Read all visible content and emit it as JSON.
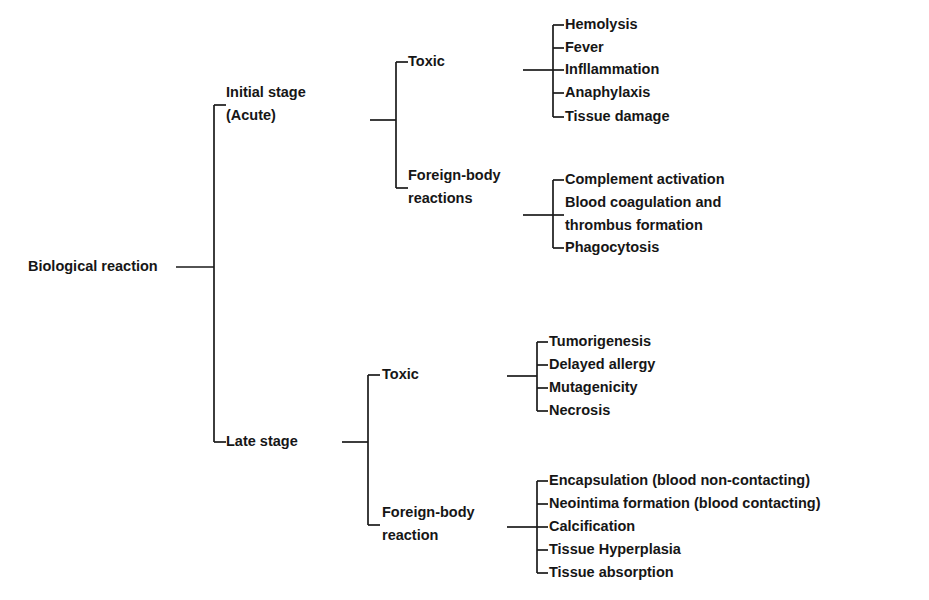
{
  "diagram": {
    "type": "tree",
    "orientation": "left-to-right",
    "title": "Biological reaction",
    "line_color": "#1a1a1a",
    "text_color": "#161616",
    "background_color": "#ffffff",
    "root": {
      "label": "Biological reaction",
      "children": [
        {
          "label": "Initial stage\n(Acute)",
          "lines": [
            "Initial stage",
            "(Acute)"
          ],
          "children": [
            {
              "label": "Toxic",
              "lines": [
                "Toxic"
              ],
              "children": [
                {
                  "label": "Hemolysis",
                  "lines": [
                    "Hemolysis"
                  ]
                },
                {
                  "label": "Fever",
                  "lines": [
                    "Fever"
                  ]
                },
                {
                  "label": "Infllammation",
                  "lines": [
                    "Infllammation"
                  ]
                },
                {
                  "label": "Anaphylaxis",
                  "lines": [
                    "Anaphylaxis"
                  ]
                },
                {
                  "label": "Tissue damage",
                  "lines": [
                    "Tissue damage"
                  ]
                }
              ]
            },
            {
              "label": "Foreign-body reactions",
              "lines": [
                "Foreign-body",
                "reactions"
              ],
              "children": [
                {
                  "label": "Complement activation",
                  "lines": [
                    "Complement activation"
                  ]
                },
                {
                  "label": "Blood coagulation and thrombus formation",
                  "lines": [
                    "Blood coagulation and",
                    "thrombus formation"
                  ]
                },
                {
                  "label": "Phagocytosis",
                  "lines": [
                    "Phagocytosis"
                  ]
                }
              ]
            }
          ]
        },
        {
          "label": "Late stage",
          "lines": [
            "Late stage"
          ],
          "children": [
            {
              "label": "Toxic",
              "lines": [
                "Toxic"
              ],
              "children": [
                {
                  "label": "Tumorigenesis",
                  "lines": [
                    "Tumorigenesis"
                  ]
                },
                {
                  "label": "Delayed allergy",
                  "lines": [
                    "Delayed allergy"
                  ]
                },
                {
                  "label": "Mutagenicity",
                  "lines": [
                    "Mutagenicity"
                  ]
                },
                {
                  "label": "Necrosis",
                  "lines": [
                    "Necrosis"
                  ]
                }
              ]
            },
            {
              "label": "Foreign-body reaction",
              "lines": [
                "Foreign-body",
                "reaction"
              ],
              "children": [
                {
                  "label": "Encapsulation  (blood non-contacting)",
                  "lines": [
                    "Encapsulation  (blood non-contacting)"
                  ]
                },
                {
                  "label": "Neointima formation (blood contacting)",
                  "lines": [
                    "Neointima formation (blood contacting)"
                  ]
                },
                {
                  "label": "Calcification",
                  "lines": [
                    "Calcification"
                  ]
                },
                {
                  "label": "Tissue Hyperplasia",
                  "lines": [
                    "Tissue Hyperplasia"
                  ]
                },
                {
                  "label": "Tissue absorption",
                  "lines": [
                    "Tissue absorption"
                  ]
                }
              ]
            }
          ]
        }
      ]
    },
    "layout": {
      "root_text_x": 28,
      "root_text_y": 267,
      "root_stub_x1": 176,
      "root_stub_x2": 214,
      "level1_bracket_x": 214,
      "level1_text_x": 226,
      "level2_bracket_x": 396,
      "level2_text_x": 408,
      "level3_bracket_x": 553,
      "level3_text_x": 565,
      "level3_bracket_x_late": 537,
      "level3_text_x_late": 549,
      "line_height": 23,
      "font_size": 14.5
    },
    "nodes": [
      {
        "name": "initial-stage",
        "bracket_x": 214,
        "text_x": 226,
        "y": 105,
        "lines": [
          "Initial stage",
          "(Acute)"
        ],
        "stub_from": 214,
        "stub_to": 226
      },
      {
        "name": "late-stage",
        "bracket_x": 214,
        "text_x": 226,
        "y": 442,
        "lines": [
          "Late stage"
        ],
        "stub_from": 214,
        "stub_to": 226
      },
      {
        "name": "initial-toxic",
        "bracket_x": 396,
        "text_x": 408,
        "y": 62,
        "lines": [
          "Toxic"
        ]
      },
      {
        "name": "initial-foreign-body",
        "bracket_x": 396,
        "text_x": 408,
        "y": 188,
        "lines": [
          "Foreign-body",
          "reactions"
        ]
      },
      {
        "name": "late-toxic",
        "bracket_x": 368,
        "text_x": 382,
        "y": 375,
        "lines": [
          "Toxic"
        ]
      },
      {
        "name": "late-foreign-body",
        "bracket_x": 368,
        "text_x": 382,
        "y": 525,
        "lines": [
          "Foreign-body",
          "reaction"
        ]
      }
    ]
  }
}
